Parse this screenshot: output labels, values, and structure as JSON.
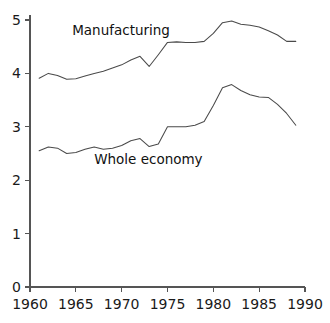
{
  "chart_data": {
    "type": "line",
    "title": "",
    "subtitle": "",
    "xlabel": "",
    "ylabel": "",
    "xlim": [
      1960,
      1990
    ],
    "ylim": [
      0,
      5
    ],
    "grid": false,
    "legend_position": "inline-annotation",
    "x_ticks": [
      1960,
      1965,
      1970,
      1975,
      1980,
      1985,
      1990
    ],
    "x_tick_labels": [
      "1960",
      "1965",
      "1970",
      "1975",
      "1980",
      "1985",
      "1990"
    ],
    "y_ticks": [
      0,
      1,
      2,
      3,
      4,
      5
    ],
    "y_tick_labels": [
      "0",
      "1",
      "2",
      "3",
      "4",
      "5"
    ],
    "x": [
      1961,
      1962,
      1963,
      1964,
      1965,
      1966,
      1967,
      1968,
      1969,
      1970,
      1971,
      1972,
      1973,
      1974,
      1975,
      1976,
      1977,
      1978,
      1979,
      1980,
      1981,
      1982,
      1983,
      1984,
      1985,
      1986,
      1987,
      1988,
      1989
    ],
    "series": [
      {
        "name": "Manufacturing",
        "label": "Manufacturing",
        "label_x": 1964.6,
        "label_y": 4.72,
        "color": "#4a4a4a",
        "values": [
          3.91,
          4.0,
          3.96,
          3.89,
          3.9,
          3.95,
          4.0,
          4.04,
          4.1,
          4.16,
          4.25,
          4.32,
          4.13,
          4.35,
          4.58,
          4.59,
          4.58,
          4.58,
          4.6,
          4.75,
          4.95,
          4.98,
          4.92,
          4.9,
          4.87,
          4.8,
          4.72,
          4.6,
          4.6
        ]
      },
      {
        "name": "Whole economy",
        "label": "Whole economy",
        "label_x": 1967.0,
        "label_y": 2.3,
        "color": "#4a4a4a",
        "values": [
          2.55,
          2.62,
          2.6,
          2.5,
          2.52,
          2.58,
          2.62,
          2.58,
          2.6,
          2.65,
          2.74,
          2.78,
          2.63,
          2.68,
          3.0,
          3.0,
          3.0,
          3.03,
          3.1,
          3.4,
          3.73,
          3.79,
          3.68,
          3.6,
          3.56,
          3.55,
          3.42,
          3.25,
          3.03
        ]
      }
    ],
    "annotations": [
      {
        "text": "Manufacturing",
        "x": 1964.6,
        "y": 4.72
      },
      {
        "text": "Whole economy",
        "x": 1967.0,
        "y": 2.3
      }
    ],
    "colors": {
      "axis": "#555555",
      "line": "#4a4a4a",
      "text": "#111111",
      "background": "#ffffff"
    }
  }
}
